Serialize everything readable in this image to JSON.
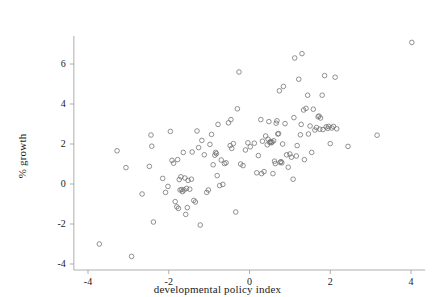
{
  "chart_data": {
    "type": "scatter",
    "title": "",
    "xlabel": "developmental policy index",
    "ylabel": "% growth",
    "xlim": [
      -4.35,
      4.35
    ],
    "ylim": [
      -4.3,
      7.4
    ],
    "xticks": [
      -4,
      -2,
      0,
      2,
      4
    ],
    "xticklabels": [
      "-4",
      "-2",
      "0",
      "2",
      "4"
    ],
    "yticks": [
      -4,
      -2,
      0,
      2,
      4,
      6
    ],
    "yticklabels": [
      "-4",
      "-2",
      "0",
      "2",
      "4",
      "6"
    ],
    "grid": false,
    "legend": null,
    "marker": "open-circle",
    "marker_color": "#6e6e6e",
    "marker_size": 4.6,
    "axis_color": "#9a9a9a",
    "text_color": "#1a1a1a",
    "background": "#ffffff",
    "n_points": 139,
    "points": [
      [
        -3.72,
        -3.0
      ],
      [
        -3.28,
        1.66
      ],
      [
        -3.06,
        0.82
      ],
      [
        -2.92,
        -3.62
      ],
      [
        -2.66,
        -0.5
      ],
      [
        -2.48,
        0.88
      ],
      [
        -2.44,
        2.45
      ],
      [
        -2.42,
        1.89
      ],
      [
        -2.38,
        -1.9
      ],
      [
        -2.15,
        0.28
      ],
      [
        -2.08,
        -0.42
      ],
      [
        -2.02,
        -0.12
      ],
      [
        -1.96,
        2.63
      ],
      [
        -1.92,
        1.18
      ],
      [
        -1.88,
        1.04
      ],
      [
        -1.84,
        -0.88
      ],
      [
        -1.8,
        -1.14
      ],
      [
        -1.78,
        1.22
      ],
      [
        -1.76,
        -1.22
      ],
      [
        -1.74,
        0.22
      ],
      [
        -1.72,
        -0.3
      ],
      [
        -1.7,
        0.36
      ],
      [
        -1.68,
        -0.28
      ],
      [
        -1.66,
        -0.38
      ],
      [
        -1.64,
        1.58
      ],
      [
        -1.62,
        -0.3
      ],
      [
        -1.6,
        0.3
      ],
      [
        -1.58,
        -1.52
      ],
      [
        -1.56,
        -0.22
      ],
      [
        -1.52,
        0.18
      ],
      [
        -1.48,
        -0.26
      ],
      [
        -1.42,
        1.6
      ],
      [
        -1.38,
        -0.82
      ],
      [
        -1.34,
        -0.9
      ],
      [
        -1.3,
        2.65
      ],
      [
        -1.26,
        1.82
      ],
      [
        -1.22,
        -2.05
      ],
      [
        -1.18,
        2.18
      ],
      [
        -1.12,
        1.46
      ],
      [
        -1.06,
        -0.42
      ],
      [
        -1.02,
        -0.3
      ],
      [
        -0.98,
        1.98
      ],
      [
        -0.94,
        2.48
      ],
      [
        -0.9,
        0.96
      ],
      [
        -0.86,
        1.44
      ],
      [
        -0.84,
        1.58
      ],
      [
        -0.82,
        1.52
      ],
      [
        -0.8,
        0.42
      ],
      [
        -0.78,
        2.98
      ],
      [
        -0.74,
        -0.08
      ],
      [
        -0.7,
        1.2
      ],
      [
        -0.66,
        -0.02
      ],
      [
        -0.62,
        1.02
      ],
      [
        -0.58,
        1.06
      ],
      [
        -0.52,
        3.06
      ],
      [
        -0.48,
        1.92
      ],
      [
        -0.46,
        3.22
      ],
      [
        -0.44,
        1.78
      ],
      [
        -0.4,
        2.02
      ],
      [
        -0.34,
        -1.4
      ],
      [
        -0.3,
        3.76
      ],
      [
        -0.26,
        5.6
      ],
      [
        -0.22,
        1.0
      ],
      [
        -0.16,
        0.92
      ],
      [
        -0.1,
        1.7
      ],
      [
        0.02,
        1.86
      ],
      [
        0.12,
        2.04
      ],
      [
        0.18,
        0.56
      ],
      [
        0.22,
        1.42
      ],
      [
        0.28,
        3.22
      ],
      [
        0.32,
        2.14
      ],
      [
        0.36,
        0.62
      ],
      [
        0.4,
        2.4
      ],
      [
        0.44,
        1.96
      ],
      [
        0.46,
        2.24
      ],
      [
        0.48,
        3.12
      ],
      [
        0.5,
        2.08
      ],
      [
        0.52,
        2.12
      ],
      [
        0.54,
        2.06
      ],
      [
        0.56,
        2.1
      ],
      [
        0.58,
        0.52
      ],
      [
        0.6,
        2.16
      ],
      [
        0.62,
        1.14
      ],
      [
        0.64,
        1.02
      ],
      [
        0.66,
        3.04
      ],
      [
        0.68,
        3.16
      ],
      [
        0.7,
        2.5
      ],
      [
        0.72,
        2.52
      ],
      [
        0.74,
        4.66
      ],
      [
        0.76,
        1.08
      ],
      [
        0.78,
        1.12
      ],
      [
        0.8,
        1.06
      ],
      [
        0.82,
        2.0
      ],
      [
        0.84,
        4.88
      ],
      [
        0.88,
        3.02
      ],
      [
        0.92,
        1.46
      ],
      [
        0.96,
        0.84
      ],
      [
        1.0,
        1.5
      ],
      [
        1.04,
        1.34
      ],
      [
        1.08,
        0.24
      ],
      [
        1.12,
        6.3
      ],
      [
        1.16,
        1.4
      ],
      [
        1.18,
        1.92
      ],
      [
        1.22,
        5.24
      ],
      [
        1.26,
        2.46
      ],
      [
        1.3,
        6.52
      ],
      [
        1.34,
        3.7
      ],
      [
        1.36,
        1.22
      ],
      [
        1.4,
        3.78
      ],
      [
        1.44,
        4.44
      ],
      [
        1.46,
        2.5
      ],
      [
        1.5,
        2.9
      ],
      [
        1.54,
        1.58
      ],
      [
        1.58,
        3.74
      ],
      [
        1.62,
        2.7
      ],
      [
        1.66,
        2.82
      ],
      [
        1.7,
        3.36
      ],
      [
        1.72,
        3.4
      ],
      [
        1.74,
        2.74
      ],
      [
        1.76,
        3.3
      ],
      [
        1.8,
        4.44
      ],
      [
        1.82,
        2.72
      ],
      [
        1.86,
        5.42
      ],
      [
        1.9,
        2.86
      ],
      [
        1.94,
        2.78
      ],
      [
        1.96,
        2.88
      ],
      [
        2.0,
        2.02
      ],
      [
        2.04,
        2.8
      ],
      [
        2.08,
        2.88
      ],
      [
        2.12,
        5.34
      ],
      [
        2.16,
        2.76
      ],
      [
        2.44,
        1.88
      ],
      [
        3.16,
        2.44
      ],
      [
        4.02,
        7.08
      ],
      [
        -0.04,
        2.06
      ],
      [
        0.3,
        0.52
      ],
      [
        1.1,
        3.32
      ],
      [
        1.28,
        2.98
      ],
      [
        -1.44,
        0.24
      ],
      [
        -1.54,
        -1.18
      ]
    ]
  },
  "plot_geometry": {
    "x_pixel_at_minus4": 88,
    "x_pixel_at_plus4": 411,
    "y_pixel_at_6": 64,
    "y_pixel_at_minus4": 264
  }
}
